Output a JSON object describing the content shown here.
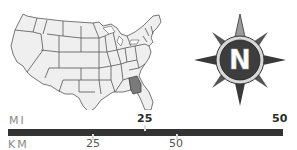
{
  "map": {
    "subject": "United States map with state outlines",
    "highlighted_state": "Georgia",
    "fill_color": "#efefef",
    "border_color": "#555555",
    "highlight_color": "#7a7a7a"
  },
  "compass": {
    "letter": "N",
    "ring_color": "#444444",
    "points_color": "#3a3a3a"
  },
  "scale": {
    "mi_label": "MI",
    "km_label": "KM",
    "mi_ticks": [
      "25",
      "50"
    ],
    "km_ticks": [
      "25",
      "50"
    ],
    "bar_color": "#333333"
  }
}
